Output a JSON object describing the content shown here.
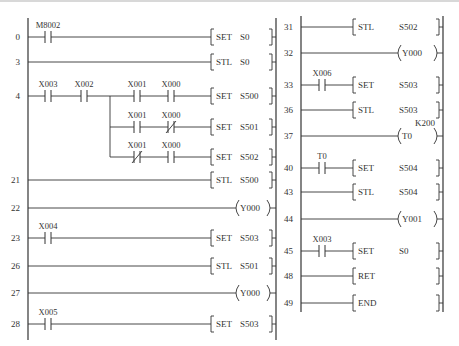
{
  "diagram": {
    "type": "ladder-diagram",
    "columns": [
      {
        "rail_left_x": 28,
        "rail_right_x": 276,
        "rail_top": 18,
        "rail_bottom": 340,
        "bracket_x": 211,
        "coil_x": 236,
        "rungs": [
          {
            "step": "0",
            "y": 37,
            "contacts": [
              {
                "label": "M8002",
                "type": "NO",
                "x": 48
              }
            ],
            "instr": {
              "kind": "bracket",
              "op": "SET",
              "arg": "S0"
            }
          },
          {
            "step": "3",
            "y": 62,
            "contacts": [],
            "instr": {
              "kind": "bracket",
              "op": "STL",
              "arg": "S0"
            }
          },
          {
            "step": "4",
            "y": 96,
            "contacts": [
              {
                "label": "X003",
                "type": "NO",
                "x": 48
              },
              {
                "label": "X002",
                "type": "NO",
                "x": 84
              },
              {
                "label": "X001",
                "type": "NO",
                "x": 137
              },
              {
                "label": "X000",
                "type": "NO",
                "x": 171
              }
            ],
            "instr": {
              "kind": "bracket",
              "op": "SET",
              "arg": "S500"
            }
          },
          {
            "step": "",
            "y": 127,
            "branch_from_x": 110,
            "contacts": [
              {
                "label": "X001",
                "type": "NO",
                "x": 137
              },
              {
                "label": "X000",
                "type": "NC",
                "x": 171
              }
            ],
            "instr": {
              "kind": "bracket",
              "op": "SET",
              "arg": "S501"
            }
          },
          {
            "step": "",
            "y": 157,
            "branch_from_x": 110,
            "contacts": [
              {
                "label": "X001",
                "type": "NC",
                "x": 137
              },
              {
                "label": "X000",
                "type": "NO",
                "x": 171
              }
            ],
            "instr": {
              "kind": "bracket",
              "op": "SET",
              "arg": "S502"
            }
          },
          {
            "step": "21",
            "y": 180,
            "contacts": [],
            "instr": {
              "kind": "bracket",
              "op": "STL",
              "arg": "S500"
            }
          },
          {
            "step": "22",
            "y": 208,
            "contacts": [],
            "instr": {
              "kind": "coil",
              "op": "",
              "arg": "Y000"
            }
          },
          {
            "step": "23",
            "y": 238,
            "contacts": [
              {
                "label": "X004",
                "type": "NO",
                "x": 48
              }
            ],
            "instr": {
              "kind": "bracket",
              "op": "SET",
              "arg": "S503"
            }
          },
          {
            "step": "26",
            "y": 266,
            "contacts": [],
            "instr": {
              "kind": "bracket",
              "op": "STL",
              "arg": "S501"
            }
          },
          {
            "step": "27",
            "y": 293,
            "contacts": [],
            "instr": {
              "kind": "coil",
              "op": "",
              "arg": "Y000"
            }
          },
          {
            "step": "28",
            "y": 324,
            "contacts": [
              {
                "label": "X005",
                "type": "NO",
                "x": 48
              }
            ],
            "instr": {
              "kind": "bracket",
              "op": "SET",
              "arg": "S503"
            }
          }
        ]
      },
      {
        "rail_left_x": 301,
        "rail_right_x": 443,
        "rail_top": 16,
        "rail_bottom": 312,
        "bracket_x": 353,
        "coil_x": 398,
        "rungs": [
          {
            "step": "31",
            "y": 27,
            "contacts": [],
            "instr": {
              "kind": "bracket",
              "op": "STL",
              "arg": "S502"
            }
          },
          {
            "step": "32",
            "y": 53,
            "contacts": [],
            "instr": {
              "kind": "coil",
              "op": "",
              "arg": "Y000"
            }
          },
          {
            "step": "33",
            "y": 85,
            "contacts": [
              {
                "label": "X006",
                "type": "NO",
                "x": 322
              }
            ],
            "instr": {
              "kind": "bracket",
              "op": "SET",
              "arg": "S503"
            }
          },
          {
            "step": "36",
            "y": 110,
            "contacts": [],
            "instr": {
              "kind": "bracket",
              "op": "STL",
              "arg": "S503"
            }
          },
          {
            "step": "37",
            "y": 136,
            "contacts": [],
            "instr": {
              "kind": "coil",
              "op": "",
              "arg": "T0",
              "preset": "K200"
            }
          },
          {
            "step": "40",
            "y": 168,
            "contacts": [
              {
                "label": "T0",
                "type": "NO",
                "x": 322
              }
            ],
            "instr": {
              "kind": "bracket",
              "op": "SET",
              "arg": "S504"
            }
          },
          {
            "step": "43",
            "y": 192,
            "contacts": [],
            "instr": {
              "kind": "bracket",
              "op": "STL",
              "arg": "S504"
            }
          },
          {
            "step": "44",
            "y": 219,
            "contacts": [],
            "instr": {
              "kind": "coil",
              "op": "",
              "arg": "Y001"
            }
          },
          {
            "step": "45",
            "y": 251,
            "contacts": [
              {
                "label": "X003",
                "type": "NO",
                "x": 322
              }
            ],
            "instr": {
              "kind": "bracket",
              "op": "SET",
              "arg": "S0"
            }
          },
          {
            "step": "48",
            "y": 276,
            "contacts": [],
            "instr": {
              "kind": "bracket-single",
              "op": "RET",
              "arg": ""
            }
          },
          {
            "step": "49",
            "y": 303,
            "contacts": [],
            "instr": {
              "kind": "bracket-single",
              "op": "END",
              "arg": ""
            }
          }
        ]
      }
    ],
    "branch": {
      "x": 110,
      "from_y": 96,
      "to_y": 157
    }
  },
  "colors": {
    "line": "#333333",
    "text": "#333333",
    "background": "#ffffff"
  }
}
